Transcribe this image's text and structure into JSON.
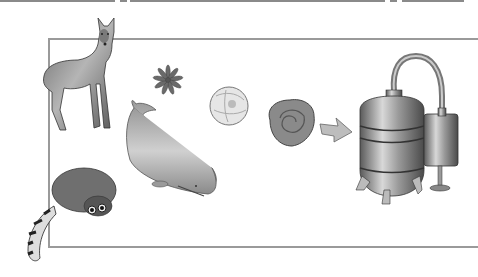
{
  "illustration": {
    "subject": "perfume ingredient sources and distillation",
    "elements": [
      {
        "id": "deer",
        "name": "musk-deer-figure"
      },
      {
        "id": "flower-small",
        "name": "small-flower-figure"
      },
      {
        "id": "whale",
        "name": "sperm-whale-figure"
      },
      {
        "id": "civet",
        "name": "civet-figure"
      },
      {
        "id": "blossom",
        "name": "white-blossom-figure"
      },
      {
        "id": "rose",
        "name": "rose-figure"
      },
      {
        "id": "arrow",
        "name": "arrow-icon"
      },
      {
        "id": "still",
        "name": "distillation-apparatus-figure"
      }
    ],
    "colors": {
      "frame": "#9a9a9a",
      "background": "#ffffff",
      "metal": "#8c8c8c",
      "dark": "#4a4a4a"
    }
  }
}
